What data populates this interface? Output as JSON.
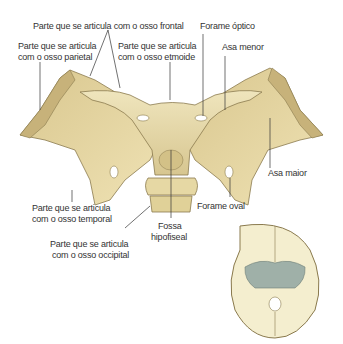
{
  "labels": {
    "frontal": "Parte que se articula com o osso frontal",
    "parietal_1": "Parte que se articula",
    "parietal_2": "com o osso parietal",
    "etmoide_1": "Parte que se articula",
    "etmoide_2": "com o osso etmoide",
    "optico": "Forame óptico",
    "asa_menor": "Asa menor",
    "asa_maior": "Asa maior",
    "temporal_1": "Parte que se articula",
    "temporal_2": "com o osso temporal",
    "fossa_1": "Fossa",
    "fossa_2": "hipofiseal",
    "oval": "Forame oval",
    "occipital_1": "Parte que se articula",
    "occipital_2": "com o osso occipital"
  },
  "colors": {
    "bone": "#e8dcae",
    "bone_shadow": "#c9b77f",
    "bone_edge": "#8a7a4e",
    "skull_base": "#f4eecf",
    "sphenoid_highlight": "#9fb0a8",
    "leader_line": "#333333"
  }
}
